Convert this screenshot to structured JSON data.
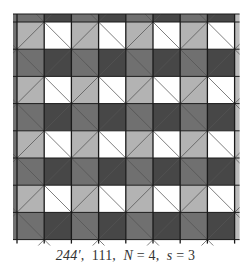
{
  "figure": {
    "caption": {
      "code": "244′",
      "sep1": ",",
      "number": "111",
      "sep2": ",",
      "n_label": "N",
      "n_eq": " = 4",
      "sep3": ",",
      "s_label": "s",
      "s_eq": " = 3"
    },
    "grid": {
      "x0": 17,
      "y0": 16,
      "cell": 27.2,
      "cols": 8,
      "rows": 8,
      "top_strip": 6,
      "right_strip": 5
    },
    "colors": {
      "light_a": "#b3b3b3",
      "light_b": "#ffffff",
      "dark_a": "#707070",
      "dark_b": "#474747",
      "grid_line": "#1a1a1a",
      "diag_line": "#555555",
      "edge_strip": "#bcbcbc"
    }
  }
}
